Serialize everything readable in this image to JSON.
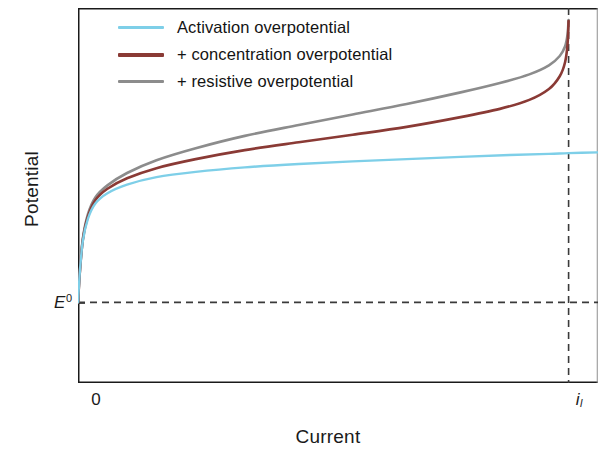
{
  "chart_data": {
    "type": "line",
    "title": "",
    "xlabel": "Current",
    "ylabel": "Potential",
    "xticks": [
      "0",
      "i_l"
    ],
    "xtick_labels": [
      "0",
      "i"
    ],
    "xtick_sub": [
      "",
      "l"
    ],
    "yticks": [
      "E^0"
    ],
    "ytick_label": "E",
    "ytick_sup": "0",
    "grid": false,
    "legend_position": "top-left",
    "xlim": [
      0,
      1.06
    ],
    "ylim": [
      0,
      1
    ],
    "annotations": [
      "horizontal dashed reference line at E0",
      "vertical dashed asymptote at limiting current i_l"
    ],
    "series": [
      {
        "name": "Activation overpotential",
        "color": "#7ecfe8",
        "x": [
          0.0,
          0.004,
          0.01,
          0.02,
          0.035,
          0.06,
          0.1,
          0.16,
          0.24,
          0.34,
          0.45,
          0.56,
          0.67,
          0.78,
          0.88,
          0.96,
          1.0,
          1.06
        ],
        "y": [
          0.215,
          0.3,
          0.38,
          0.437,
          0.478,
          0.506,
          0.529,
          0.549,
          0.563,
          0.575,
          0.584,
          0.591,
          0.597,
          0.603,
          0.608,
          0.611,
          0.613,
          0.615
        ]
      },
      {
        "name": "+ concentration overpotential",
        "color": "#8a3a35",
        "x": [
          0.0,
          0.004,
          0.01,
          0.02,
          0.035,
          0.06,
          0.1,
          0.16,
          0.24,
          0.34,
          0.45,
          0.56,
          0.67,
          0.78,
          0.86,
          0.92,
          0.96,
          0.982,
          0.993,
          0.998,
          1.0
        ],
        "y": [
          0.215,
          0.3,
          0.383,
          0.443,
          0.487,
          0.518,
          0.546,
          0.573,
          0.597,
          0.621,
          0.642,
          0.662,
          0.683,
          0.709,
          0.731,
          0.755,
          0.784,
          0.818,
          0.856,
          0.905,
          0.965
        ]
      },
      {
        "name": "+ resistive overpotential",
        "color": "#8c8c8c",
        "x": [
          0.0,
          0.004,
          0.01,
          0.02,
          0.035,
          0.06,
          0.1,
          0.16,
          0.24,
          0.34,
          0.45,
          0.56,
          0.67,
          0.78,
          0.86,
          0.92,
          0.96,
          0.982,
          0.993,
          0.998,
          1.0
        ],
        "y": [
          0.215,
          0.301,
          0.386,
          0.449,
          0.494,
          0.527,
          0.56,
          0.594,
          0.626,
          0.659,
          0.688,
          0.716,
          0.744,
          0.775,
          0.8,
          0.823,
          0.847,
          0.872,
          0.898,
          0.93,
          0.968
        ]
      }
    ]
  },
  "axes": {
    "xlabel": "Current",
    "ylabel": "Potential"
  },
  "legend": {
    "items": [
      {
        "label": "Activation overpotential",
        "color": "#7ecfe8"
      },
      {
        "label": "+ concentration overpotential",
        "color": "#8a3a35"
      },
      {
        "label": "+ resistive overpotential",
        "color": "#8c8c8c"
      }
    ]
  },
  "ticks": {
    "x_zero": "0",
    "x_limit": "i",
    "x_limit_sub": "l",
    "y_e0": "E",
    "y_e0_sup": "0"
  },
  "colors": {
    "activation": "#7ecfe8",
    "concentration": "#8a3a35",
    "resistive": "#8c8c8c",
    "axis": "#1a1a1a",
    "dashed": "#3a3a3a",
    "background": "#ffffff"
  }
}
